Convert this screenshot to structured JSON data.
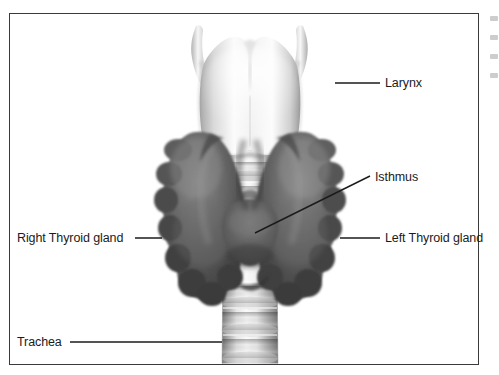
{
  "figure": {
    "background_color": "#ffffff",
    "border_color": "#3a3a3a",
    "text_color": "#1b1b1b"
  },
  "labels": {
    "larynx": "Larynx",
    "isthmus": "Isthmus",
    "left_lobe": "Left Thyroid gland",
    "right_lobe": "Right Thyroid gland",
    "trachea": "Trachea"
  },
  "anatomy": {
    "larynx": {
      "name": "larynx",
      "fill_light": "#fbfbfb",
      "fill_mid": "#d8d8d8",
      "fill_shadow": "#9e9e9e"
    },
    "thyroid_gland": {
      "name": "thyroid-gland",
      "fill_light": "#8e8e8e",
      "fill_mid": "#5e5e5e",
      "fill_dark": "#3b3b3b"
    },
    "trachea": {
      "name": "trachea",
      "fill_light": "#f2f2f2",
      "fill_mid": "#c2c2c2",
      "fill_dark": "#8a8a8a",
      "ring_count": 6
    }
  },
  "leader_lines": {
    "larynx": {
      "x1": 335,
      "y1": 83,
      "x2": 380,
      "y2": 83
    },
    "isthmus": {
      "x1": 255,
      "y1": 233,
      "x2": 370,
      "y2": 176
    },
    "left_lobe": {
      "x1": 340,
      "y1": 238,
      "x2": 380,
      "y2": 238
    },
    "right_lobe": {
      "x1": 135,
      "y1": 238,
      "x2": 162,
      "y2": 238
    },
    "trachea": {
      "x1": 70,
      "y1": 342,
      "x2": 222,
      "y2": 342
    },
    "color": "#1b1b1b",
    "width": 1.4
  }
}
